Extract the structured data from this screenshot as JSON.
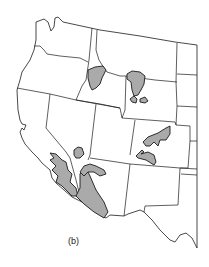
{
  "map": {
    "title": "Western United States",
    "caption": "(b)",
    "colors": {
      "background": "#ffffff",
      "boundary": "#1a1a1a",
      "highlight_fill": "#aaaaaa"
    },
    "highlighted_regions": [
      {
        "name": "idaho-region"
      },
      {
        "name": "wyoming-north-region"
      },
      {
        "name": "wyoming-south-region-west"
      },
      {
        "name": "wyoming-south-region-east"
      },
      {
        "name": "colorado-region-north"
      },
      {
        "name": "colorado-region-south"
      },
      {
        "name": "nevada-region"
      },
      {
        "name": "california-region-central"
      },
      {
        "name": "california-desert-region"
      },
      {
        "name": "utah-arizona-arm-region"
      }
    ]
  }
}
